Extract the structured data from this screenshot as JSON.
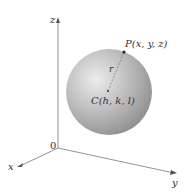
{
  "diagram": {
    "type": "sphere-in-3d-coordinates",
    "axes": {
      "x": "x",
      "y": "y",
      "z": "z",
      "origin": "0"
    },
    "point_p": "P(x, y, z)",
    "center": "C(h, k, l)",
    "radius": "r",
    "colors": {
      "axis": "#777777",
      "sphere_light": "#e6e6e6",
      "sphere_dark": "#8c8c8c",
      "text": "#333333"
    }
  }
}
